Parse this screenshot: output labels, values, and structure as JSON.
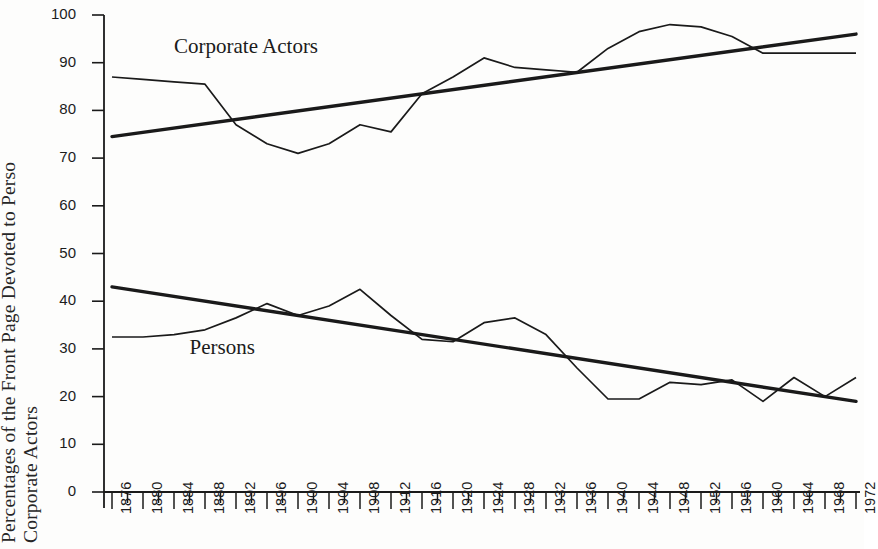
{
  "chart_data": {
    "type": "line",
    "title": "",
    "xlabel": "",
    "ylabel_line1": "Percentages of the Front Page Devoted to Persons /",
    "ylabel_line2": "Corporate Actors",
    "ylabel_visible_line1": "Percentages of the Front Page Devoted to Perso",
    "ylabel_visible_line2": "Corporate Actors",
    "xlim": [
      1876,
      1972
    ],
    "ylim": [
      0,
      100
    ],
    "y_ticks": [
      0,
      10,
      20,
      30,
      40,
      50,
      60,
      70,
      80,
      90,
      100
    ],
    "y_tick_labels": [
      "0",
      "10",
      "20",
      "30",
      "40",
      "50",
      "60",
      "70",
      "80",
      "90",
      "100"
    ],
    "x_ticks": [
      1876,
      1880,
      1884,
      1888,
      1892,
      1896,
      1900,
      1904,
      1908,
      1912,
      1916,
      1920,
      1924,
      1928,
      1932,
      1936,
      1940,
      1944,
      1948,
      1952,
      1956,
      1960,
      1964,
      1968,
      1972
    ],
    "x_tick_labels": [
      "1876",
      "1880",
      "1884",
      "1888",
      "1892",
      "1896",
      "1900",
      "1904",
      "1908",
      "1912",
      "1916",
      "1920",
      "1924",
      "1928",
      "1932",
      "1936",
      "1940",
      "1944",
      "1948",
      "1952",
      "1956",
      "1960",
      "1964",
      "1968",
      "1972"
    ],
    "x_minor_step": 2,
    "grid": false,
    "legend": "inline-labels",
    "line_color": "#1a1a1a",
    "series": [
      {
        "name": "Corporate Actors",
        "label_position": {
          "x": 1884,
          "y": 93
        },
        "x": [
          1876,
          1880,
          1884,
          1888,
          1892,
          1896,
          1900,
          1904,
          1908,
          1912,
          1916,
          1920,
          1924,
          1928,
          1932,
          1936,
          1940,
          1944,
          1948,
          1952,
          1956,
          1960,
          1964,
          1968,
          1972
        ],
        "values": [
          87,
          86.5,
          86,
          85.5,
          77,
          73,
          71,
          73,
          77,
          75.5,
          83.5,
          87,
          91,
          89,
          88.5,
          88,
          93,
          96.5,
          98,
          97.5,
          95.5,
          92,
          92,
          92,
          92
        ]
      },
      {
        "name": "Persons",
        "label_position": {
          "x": 1886,
          "y": 30
        },
        "x": [
          1876,
          1880,
          1884,
          1888,
          1892,
          1896,
          1900,
          1904,
          1908,
          1912,
          1916,
          1920,
          1924,
          1928,
          1932,
          1936,
          1940,
          1944,
          1948,
          1952,
          1956,
          1960,
          1964,
          1968,
          1972
        ],
        "values": [
          32.5,
          32.5,
          33,
          34,
          36.5,
          39.5,
          37,
          39,
          42.5,
          37,
          32,
          31.5,
          35.5,
          36.5,
          33,
          26,
          19.5,
          19.5,
          23,
          22.5,
          23.5,
          19,
          24,
          20,
          24
        ]
      }
    ],
    "trend_lines": [
      {
        "name": "Corporate Actors trend",
        "x": [
          1876,
          1972
        ],
        "values": [
          74.5,
          96
        ]
      },
      {
        "name": "Persons trend",
        "x": [
          1876,
          1972
        ],
        "values": [
          43,
          19
        ]
      }
    ]
  }
}
